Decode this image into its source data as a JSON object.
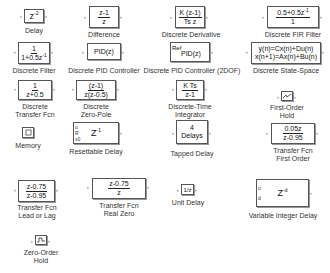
{
  "blocks": [
    {
      "id": "delay",
      "label": "Delay",
      "content": {
        "expr": "z",
        "exp": "-2"
      }
    },
    {
      "id": "difference",
      "label": "Difference",
      "content": {
        "num": "z-1",
        "den": "z"
      }
    },
    {
      "id": "discrete-derivative",
      "label": "Discrete Derivative",
      "content": {
        "num": "K (z-1)",
        "den": "Ts z"
      }
    },
    {
      "id": "discrete-fir-filter",
      "label": "Discrete FIR Filter",
      "content": {
        "num": "0.5+0.5z",
        "num_exp": "-1",
        "den": "1"
      }
    },
    {
      "id": "discrete-filter",
      "label": "Discrete Filter",
      "content": {
        "num": "1",
        "den": "1+0.5z",
        "den_exp": "-1"
      }
    },
    {
      "id": "discrete-pid-controller",
      "label": "Discrete PID Controller",
      "content": {
        "text": "PID(z)"
      }
    },
    {
      "id": "discrete-pid-controller-2dof",
      "label": "Discrete PID Controller (2DOF)",
      "content": {
        "text": "PID(z)",
        "port": "Ref"
      }
    },
    {
      "id": "discrete-state-space",
      "label": "Discrete State-Space",
      "content": {
        "line1": "y(n)=Cx(n)+Du(n)",
        "line2": "x(n+1)=Ax(n)+Bu(n)"
      }
    },
    {
      "id": "discrete-transfer-fcn",
      "label_line1": "Discrete",
      "label_line2": "Transfer Fcn",
      "content": {
        "num": "1",
        "den": "z+0.5"
      }
    },
    {
      "id": "discrete-zero-pole",
      "label_line1": "Discrete",
      "label_line2": "Zero-Pole",
      "content": {
        "num": "(z-1)",
        "den": "z(z-0.5)"
      }
    },
    {
      "id": "discrete-time-integrator",
      "label_line1": "Discrete-Time",
      "label_line2": "Integrator",
      "content": {
        "num": "K Ts",
        "den": "z-1"
      }
    },
    {
      "id": "first-order-hold",
      "label_line1": "First-Order",
      "label_line2": "Hold",
      "content": {
        "icon": "first-order-hold-icon"
      }
    },
    {
      "id": "memory",
      "label": "Memory",
      "content": {
        "icon": "memory-icon"
      }
    },
    {
      "id": "resettable-delay",
      "label": "Resettable Delay",
      "content": {
        "expr": "Z",
        "exp": "-1",
        "ports": [
          "u",
          "R",
          "x0"
        ]
      }
    },
    {
      "id": "tapped-delay",
      "label": "Tapped Delay",
      "content": {
        "line1": "4",
        "line2": "Delays"
      }
    },
    {
      "id": "transfer-fcn-first-order",
      "label_line1": "Transfer Fcn",
      "label_line2": "First Order",
      "content": {
        "num": "0.05z",
        "den": "z-0.95"
      }
    },
    {
      "id": "transfer-fcn-lead-or-lag",
      "label_line1": "Transfer Fcn",
      "label_line2": "Lead or Lag",
      "content": {
        "num": "z-0.75",
        "den": "z-0.95"
      }
    },
    {
      "id": "transfer-fcn-real-zero",
      "label_line1": "Transfer Fcn",
      "label_line2": "Real Zero",
      "content": {
        "num": "z-0.75",
        "den": "z"
      }
    },
    {
      "id": "unit-delay",
      "label": "Unit Delay",
      "content": {
        "text": "1/z"
      }
    },
    {
      "id": "variable-integer-delay",
      "label": "Variable Integer Delay",
      "content": {
        "expr": "Z",
        "exp": "-d",
        "ports": [
          "u",
          "d"
        ]
      }
    },
    {
      "id": "zero-order-hold",
      "label_line1": "Zero-Order",
      "label_line2": "Hold",
      "content": {
        "icon": "zero-order-hold-icon"
      }
    }
  ]
}
